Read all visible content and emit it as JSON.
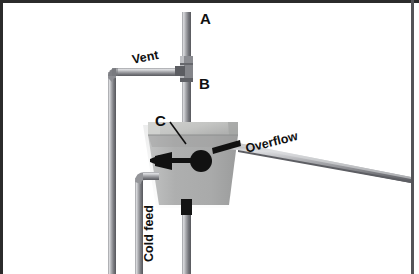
{
  "diagram": {
    "background_color": "#ffffff",
    "border_color": "#2b2b2b",
    "pipe_color": "#8f9095",
    "pipe_highlight": "#d8d9dc",
    "pipe_shadow": "#5d5e63",
    "tank_color": "#b2b3b3",
    "tank_top_color": "#c9cac8",
    "valve_color": "#111111",
    "labels": {
      "a": "A",
      "b": "B",
      "c": "C",
      "vent": "Vent",
      "overflow": "Overflow",
      "cold_feed": "Cold feed"
    },
    "components": {
      "riser_pipe": "vertical-riser-pipe",
      "vent_pipe": "vent-pipe",
      "vent_downpipe": "vent-down-pipe",
      "overflow_pipe": "overflow-pipe",
      "cold_feed_pipe": "cold-feed-pipe",
      "cistern": "cistern-tank",
      "float_ball": "float-ball",
      "float_arm": "float-arm",
      "ball_valve": "ball-valve-body",
      "tee_fitting": "tee-junction-fitting",
      "outlet_block": "tank-outlet-connector"
    }
  }
}
